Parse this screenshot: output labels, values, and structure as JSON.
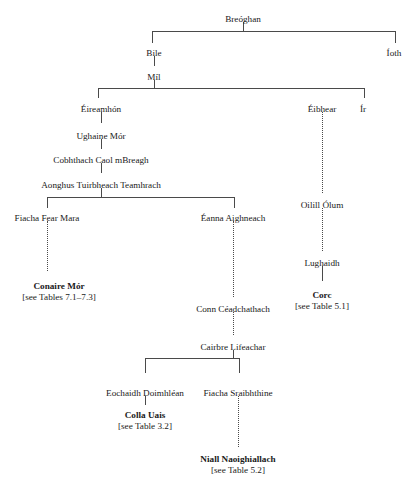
{
  "diagram": {
    "type": "genealogical-tree",
    "background_color": "#ffffff",
    "line_color": "#4a4a4a",
    "text_color": "#1a1a1a",
    "nodes": [
      {
        "id": "breoghan",
        "label": "Breóghan",
        "x": 243,
        "y": 14,
        "bold": false,
        "ref": null
      },
      {
        "id": "bile",
        "label": "Bile",
        "x": 154,
        "y": 48,
        "bold": false,
        "ref": null
      },
      {
        "id": "ioth",
        "label": "Íoth",
        "x": 394,
        "y": 48,
        "bold": false,
        "ref": null
      },
      {
        "id": "mil",
        "label": "Míl",
        "x": 154,
        "y": 72,
        "bold": false,
        "ref": null
      },
      {
        "id": "eireamhon",
        "label": "Éireamhón",
        "x": 101,
        "y": 104,
        "bold": false,
        "ref": null
      },
      {
        "id": "eibhear",
        "label": "Éibhear",
        "x": 322,
        "y": 104,
        "bold": false,
        "ref": null
      },
      {
        "id": "ir",
        "label": "Ír",
        "x": 363,
        "y": 104,
        "bold": false,
        "ref": null
      },
      {
        "id": "ughaine",
        "label": "Ughaine Mór",
        "x": 101,
        "y": 131,
        "bold": false,
        "ref": null
      },
      {
        "id": "cobhthach",
        "label": "Cobhthach Caol mBreagh",
        "x": 101,
        "y": 155,
        "bold": false,
        "ref": null
      },
      {
        "id": "aonghus",
        "label": "Aonghus Tuirbheach Teamhrach",
        "x": 101,
        "y": 180,
        "bold": false,
        "ref": null
      },
      {
        "id": "fiachafm",
        "label": "Fiacha Fear Mara",
        "x": 47,
        "y": 213,
        "bold": false,
        "ref": null
      },
      {
        "id": "eanna",
        "label": "Éanna Aighneach",
        "x": 233,
        "y": 213,
        "bold": false,
        "ref": null
      },
      {
        "id": "oilill",
        "label": "Oilill Ólum",
        "x": 322,
        "y": 200,
        "bold": false,
        "ref": null
      },
      {
        "id": "conaire",
        "label": "Conaire Mór",
        "x": 59,
        "y": 281,
        "bold": true,
        "ref": "[see Tables 7.1–7.3]"
      },
      {
        "id": "lughaidh",
        "label": "Lughaidh",
        "x": 322,
        "y": 258,
        "bold": false,
        "ref": null
      },
      {
        "id": "corc",
        "label": "Corc",
        "x": 322,
        "y": 290,
        "bold": true,
        "ref": "[see Table 5.1]"
      },
      {
        "id": "conn",
        "label": "Conn Céadchathach",
        "x": 233,
        "y": 304,
        "bold": false,
        "ref": null
      },
      {
        "id": "cairbre",
        "label": "Cairbre Lifeachar",
        "x": 233,
        "y": 342,
        "bold": false,
        "ref": null
      },
      {
        "id": "eochaidh",
        "label": "Eochaidh Doimhléan",
        "x": 145,
        "y": 388,
        "bold": false,
        "ref": null
      },
      {
        "id": "fiachasr",
        "label": "Fiacha Sraibhthine",
        "x": 238,
        "y": 388,
        "bold": false,
        "ref": null
      },
      {
        "id": "colla",
        "label": "Colla Uais",
        "x": 145,
        "y": 410,
        "bold": true,
        "ref": "[see Table 3.2]"
      },
      {
        "id": "niall",
        "label": "Niall Naoighiallach",
        "x": 238,
        "y": 454,
        "bold": true,
        "ref": "[see Table 5.2]"
      }
    ],
    "connectors": [
      {
        "id": "breoghan-stem",
        "kind": "vline",
        "style": "solid",
        "x": 243,
        "y": 22,
        "length": 9
      },
      {
        "id": "breoghan-bracket",
        "kind": "bracket",
        "style": "solid",
        "x": 152,
        "y": 31,
        "width": 242,
        "height": 11
      },
      {
        "id": "bile-mil",
        "kind": "vline",
        "style": "solid",
        "x": 154,
        "y": 56,
        "length": 10
      },
      {
        "id": "mil-stem",
        "kind": "vline",
        "style": "solid",
        "x": 154,
        "y": 80,
        "length": 8
      },
      {
        "id": "mil-bracket",
        "kind": "bracket",
        "style": "solid",
        "x": 98,
        "y": 88,
        "width": 265,
        "height": 9
      },
      {
        "id": "eireamhon-ughaine",
        "kind": "vline",
        "style": "solid",
        "x": 101,
        "y": 112,
        "length": 11
      },
      {
        "id": "ughaine-cobhthach",
        "kind": "vline",
        "style": "solid",
        "x": 101,
        "y": 139,
        "length": 10
      },
      {
        "id": "cobhthach-aonghus",
        "kind": "vline",
        "style": "solid",
        "x": 101,
        "y": 163,
        "length": 10
      },
      {
        "id": "aonghus-stem",
        "kind": "vline",
        "style": "solid",
        "x": 101,
        "y": 188,
        "length": 9
      },
      {
        "id": "aonghus-bracket",
        "kind": "bracket",
        "style": "solid",
        "x": 47,
        "y": 197,
        "width": 186,
        "height": 10
      },
      {
        "id": "fiacha-conaire",
        "kind": "vline",
        "style": "dotted",
        "x": 47,
        "y": 221,
        "length": 50
      },
      {
        "id": "eanna-conn",
        "kind": "vline",
        "style": "dotted",
        "x": 233,
        "y": 221,
        "length": 76
      },
      {
        "id": "eibhear-oilill",
        "kind": "vline",
        "style": "dotted",
        "x": 322,
        "y": 112,
        "length": 81
      },
      {
        "id": "oilill-lughaidh",
        "kind": "vline",
        "style": "dotted",
        "x": 322,
        "y": 208,
        "length": 43
      },
      {
        "id": "lughaidh-corc",
        "kind": "vline",
        "style": "solid",
        "x": 322,
        "y": 266,
        "length": 15
      },
      {
        "id": "conn-cairbre",
        "kind": "vline",
        "style": "dotted",
        "x": 233,
        "y": 312,
        "length": 23
      },
      {
        "id": "cairbre-stem",
        "kind": "vline",
        "style": "solid",
        "x": 233,
        "y": 350,
        "length": 8
      },
      {
        "id": "cairbre-bracket",
        "kind": "bracket",
        "style": "solid",
        "x": 145,
        "y": 358,
        "width": 93,
        "height": 14
      },
      {
        "id": "eochaidh-colla",
        "kind": "vline",
        "style": "solid",
        "x": 145,
        "y": 396,
        "length": 9
      },
      {
        "id": "fiachasr-niall",
        "kind": "vline",
        "style": "dotted",
        "x": 238,
        "y": 396,
        "length": 51
      }
    ]
  }
}
